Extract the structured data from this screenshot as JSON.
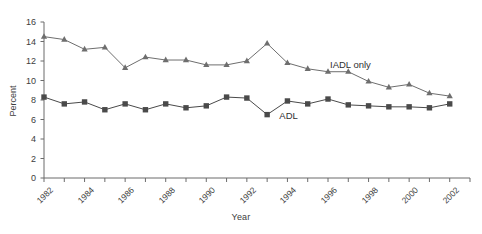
{
  "chart_data": {
    "type": "line",
    "title": "",
    "xlabel": "Year",
    "ylabel": "Percent",
    "ylim": [
      0,
      16
    ],
    "ytick_step": 2,
    "yticks": [
      0,
      2,
      4,
      6,
      8,
      10,
      12,
      14,
      16
    ],
    "xlim": [
      1982,
      2003
    ],
    "xticks": [
      1982,
      1983,
      1984,
      1985,
      1986,
      1987,
      1988,
      1989,
      1990,
      1991,
      1992,
      1993,
      1994,
      1995,
      1996,
      1997,
      1998,
      1999,
      2000,
      2001,
      2002,
      2003
    ],
    "xtick_labels": [
      "1982",
      "",
      "1984",
      "",
      "1986",
      "",
      "1988",
      "",
      "1990",
      "",
      "1992",
      "",
      "1994",
      "",
      "1996",
      "",
      "1998",
      "",
      "2000",
      "",
      "2002",
      ""
    ],
    "x": [
      1982,
      1983,
      1984,
      1985,
      1986,
      1987,
      1988,
      1989,
      1990,
      1991,
      1992,
      1993,
      1994,
      1995,
      1996,
      1997,
      1998,
      1999,
      2000,
      2001,
      2002
    ],
    "grid": false,
    "legend_position": "inline-annotation",
    "series": [
      {
        "name": "IADL only",
        "marker": "triangle",
        "color": "#6e6e6e",
        "label": "IADL only",
        "label_x": 1996.1,
        "label_y": 11.45,
        "values": [
          14.5,
          14.2,
          13.2,
          13.4,
          11.3,
          12.4,
          12.1,
          12.1,
          11.6,
          11.6,
          12.0,
          13.8,
          11.8,
          11.2,
          10.9,
          10.9,
          9.9,
          9.3,
          9.6,
          8.7,
          8.4
        ]
      },
      {
        "name": "ADL",
        "marker": "square",
        "color": "#4a4a4a",
        "label": "ADL",
        "label_x": 1993.6,
        "label_y": 6.25,
        "values": [
          8.3,
          7.6,
          7.8,
          7.0,
          7.6,
          7.0,
          7.6,
          7.2,
          7.4,
          8.3,
          8.2,
          6.5,
          7.9,
          7.6,
          8.1,
          7.5,
          7.4,
          7.3,
          7.3,
          7.2,
          7.6
        ]
      }
    ]
  },
  "axes": {
    "y_title": "Percent",
    "x_title": "Year"
  }
}
